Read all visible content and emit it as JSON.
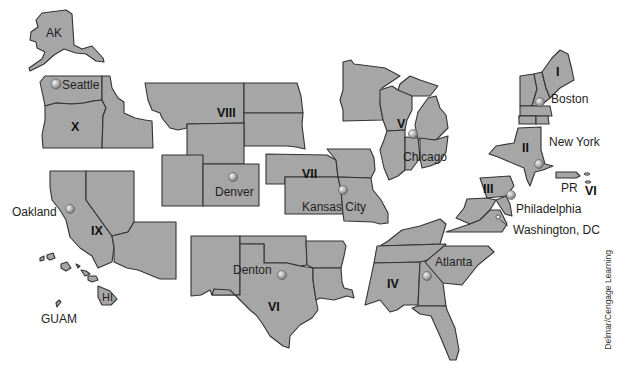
{
  "map": {
    "title": "HHS Regions of the United States",
    "fill_color": "#a6a6a6",
    "border_color": "#333333",
    "background": "#ffffff",
    "regions": [
      {
        "id": "I",
        "label": "I"
      },
      {
        "id": "II",
        "label": "II"
      },
      {
        "id": "III",
        "label": "III"
      },
      {
        "id": "IV",
        "label": "IV"
      },
      {
        "id": "V",
        "label": "V"
      },
      {
        "id": "VI",
        "label": "VI"
      },
      {
        "id": "VI_caribbean",
        "label": "VI"
      },
      {
        "id": "VII",
        "label": "VII"
      },
      {
        "id": "VIII",
        "label": "VIII"
      },
      {
        "id": "IX",
        "label": "IX"
      },
      {
        "id": "X",
        "label": "X"
      }
    ],
    "territory_labels": {
      "ak": "AK",
      "hi": "HI",
      "guam": "GUAM",
      "pr": "PR"
    },
    "cities": [
      {
        "name": "Seattle",
        "region": "X"
      },
      {
        "name": "Oakland",
        "region": "IX"
      },
      {
        "name": "Denver",
        "region": "VIII"
      },
      {
        "name": "Kansas City",
        "region": "VII"
      },
      {
        "name": "Denton",
        "region": "VI"
      },
      {
        "name": "Chicago",
        "region": "V"
      },
      {
        "name": "Atlanta",
        "region": "IV"
      },
      {
        "name": "Philadelphia",
        "region": "III"
      },
      {
        "name": "Washington, DC",
        "region": "III"
      },
      {
        "name": "New York",
        "region": "II"
      },
      {
        "name": "Boston",
        "region": "I"
      }
    ],
    "credit": "Delmar/Cengage Learning"
  }
}
